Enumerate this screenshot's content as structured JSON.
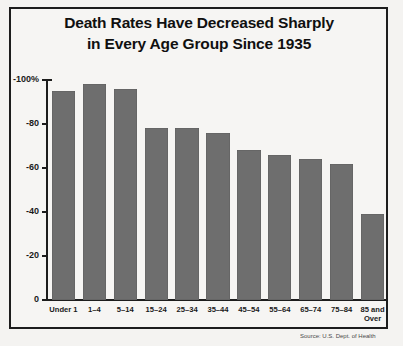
{
  "chart_data": {
    "type": "bar",
    "title": "Death Rates Have Decreased Sharply in Every Age Group Since 1935",
    "title_line1": "Death Rates Have Decreased Sharply",
    "title_line2": "in Every Age Group Since 1935",
    "xlabel": "",
    "ylabel": "",
    "ylim": [
      -100,
      0
    ],
    "grid": false,
    "legend": "none",
    "bar_color": "#6e6e6e",
    "categories": [
      "Under 1",
      "1–4",
      "5–14",
      "15–24",
      "25–34",
      "35–44",
      "45–54",
      "55–64",
      "65–74",
      "75–84",
      "85 and Over"
    ],
    "values": [
      -95,
      -98,
      -96,
      -78,
      -78,
      -76,
      -68,
      -66,
      -64,
      -62,
      -39
    ],
    "ytick_labels": [
      "-100%",
      "-80",
      "-60",
      "-40",
      "-20",
      "0"
    ],
    "ytick_values": [
      -100,
      -80,
      -60,
      -40,
      -20,
      0
    ]
  },
  "source": {
    "text": "Source: U.S. Dept. of Health"
  }
}
